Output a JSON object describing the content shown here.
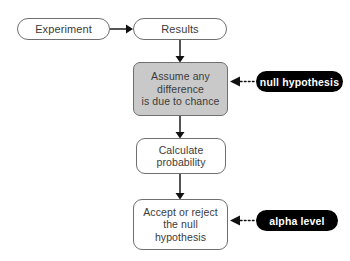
{
  "diagram": {
    "background_color": "#ffffff",
    "node_stroke_color": "#6f6f6f",
    "node_text_color": "#3b3b3b",
    "highlight_fill_color": "#c9c9c9",
    "callout_fill_color": "#000000",
    "callout_text_color": "#ffffff",
    "nodes": [
      {
        "id": "experiment",
        "label": "Experiment",
        "shape": "rounded-pill",
        "fill": "#ffffff"
      },
      {
        "id": "results",
        "label": "Results",
        "shape": "rounded-pill",
        "fill": "#ffffff"
      },
      {
        "id": "assume",
        "label": "Assume any\ndifference\nis due to chance",
        "shape": "rounded-rect",
        "fill": "#c9c9c9"
      },
      {
        "id": "calculate",
        "label": "Calculate\nprobability",
        "shape": "rounded-rect",
        "fill": "#ffffff"
      },
      {
        "id": "accept",
        "label": "Accept or reject\nthe null\nhypothesis",
        "shape": "rounded-rect",
        "fill": "#ffffff"
      }
    ],
    "callouts": [
      {
        "id": "null-hypothesis",
        "label": "null hypothesis",
        "points_to": "assume"
      },
      {
        "id": "alpha-level",
        "label": "alpha level",
        "points_to": "accept"
      }
    ],
    "connectors": [
      {
        "from": "experiment",
        "to": "results",
        "style": "solid",
        "arrow": "right"
      },
      {
        "from": "results",
        "to": "assume",
        "style": "solid",
        "arrow": "down"
      },
      {
        "from": "assume",
        "to": "calculate",
        "style": "solid",
        "arrow": "down"
      },
      {
        "from": "calculate",
        "to": "accept",
        "style": "solid",
        "arrow": "down"
      },
      {
        "from": "null-hypothesis",
        "to": "assume",
        "style": "dotted",
        "arrow": "left"
      },
      {
        "from": "alpha-level",
        "to": "accept",
        "style": "dotted",
        "arrow": "left"
      }
    ]
  }
}
